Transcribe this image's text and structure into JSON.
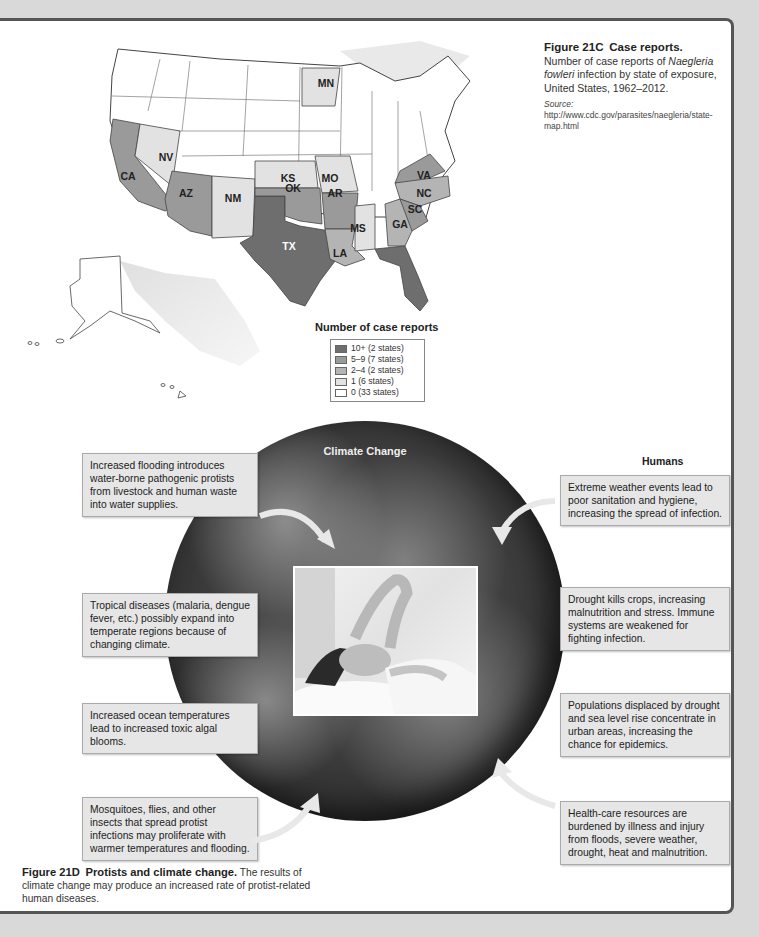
{
  "figure_21c": {
    "number": "Figure 21C",
    "title": "Case reports.",
    "description_pre": "Number of case reports of ",
    "description_italic": "Naegleria fowleri",
    "description_post": " infection by state of exposure, United States, 1962–2012.",
    "source_label": "Source:",
    "source_text": " http://www.cdc.gov/parasites/naegleria/state-map.html",
    "map": {
      "states": [
        {
          "abbr": "MN",
          "category": "1"
        },
        {
          "abbr": "NV",
          "category": "1"
        },
        {
          "abbr": "CA",
          "category": "5-9"
        },
        {
          "abbr": "KS",
          "category": "1"
        },
        {
          "abbr": "MO",
          "category": "1"
        },
        {
          "abbr": "VA",
          "category": "5-9"
        },
        {
          "abbr": "NC",
          "category": "5-9"
        },
        {
          "abbr": "AZ",
          "category": "5-9"
        },
        {
          "abbr": "NM",
          "category": "1"
        },
        {
          "abbr": "OK",
          "category": "5-9"
        },
        {
          "abbr": "AR",
          "category": "5-9"
        },
        {
          "abbr": "SC",
          "category": "5-9"
        },
        {
          "abbr": "GA",
          "category": "2-4"
        },
        {
          "abbr": "MS",
          "category": "1"
        },
        {
          "abbr": "TX",
          "category": "10+"
        },
        {
          "abbr": "LA",
          "category": "2-4"
        },
        {
          "abbr": "FL",
          "category": "10+"
        }
      ]
    },
    "legend": {
      "title": "Number of case reports",
      "items": [
        {
          "label": "10+ (2 states)",
          "color": "#6e6e6e"
        },
        {
          "label": "5–9 (7 states)",
          "color": "#9a9a9a"
        },
        {
          "label": "2–4 (2 states)",
          "color": "#b4b4b4"
        },
        {
          "label": "1 (6 states)",
          "color": "#e2e2e2"
        },
        {
          "label": "0 (33 states)",
          "color": "#ffffff"
        }
      ]
    }
  },
  "figure_21d": {
    "globe_title": "Climate Change",
    "protists": {
      "heading": "Protists",
      "boxes": [
        "Increased flooding introduces water-borne pathogenic protists from livestock and human waste into water supplies.",
        "Tropical diseases (malaria, dengue fever, etc.) possibly expand into temperate regions because of changing climate.",
        "Increased ocean temperatures lead to increased toxic algal blooms.",
        "Mosquitoes, flies, and other insects that spread protist infections may proliferate with warmer temperatures and flooding."
      ]
    },
    "humans": {
      "heading": "Humans",
      "boxes": [
        "Extreme weather events lead to poor sanitation and hygiene, increasing the spread of infection.",
        "Drought kills crops, increasing malnutrition and stress. Immune systems are weakened for fighting infection.",
        "Populations displaced by drought and sea level rise concentrate in urban areas, increasing the chance for epidemics.",
        "Health-care resources are burdened by illness and injury from floods, severe weather, drought, heat and malnutrition."
      ]
    },
    "number": "Figure 21D",
    "title": "Protists and climate change.",
    "description": " The results of climate change may produce an increased rate of protist-related human diseases."
  }
}
